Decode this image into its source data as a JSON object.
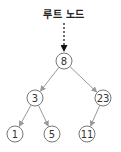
{
  "diagram": {
    "type": "binary-search-tree",
    "root_label": "루트 노드",
    "colors": {
      "edge": "#999999",
      "node_stroke": "#777777",
      "node_fill": "#ffffff",
      "pointer": "#111111",
      "text": "#333333"
    },
    "nodes": [
      {
        "id": "n8",
        "value": "8",
        "cx": 64,
        "cy": 61,
        "r": 8
      },
      {
        "id": "n3",
        "value": "3",
        "cx": 35,
        "cy": 98,
        "r": 8
      },
      {
        "id": "n23",
        "value": "23",
        "cx": 103,
        "cy": 98,
        "r": 8
      },
      {
        "id": "n1",
        "value": "1",
        "cx": 15,
        "cy": 134,
        "r": 8
      },
      {
        "id": "n5",
        "value": "5",
        "cx": 52,
        "cy": 134,
        "r": 8
      },
      {
        "id": "n11",
        "value": "11",
        "cx": 87,
        "cy": 134,
        "r": 8
      }
    ],
    "edges": [
      {
        "from": "n8",
        "to": "n3"
      },
      {
        "from": "n8",
        "to": "n23"
      },
      {
        "from": "n3",
        "to": "n1"
      },
      {
        "from": "n3",
        "to": "n5"
      },
      {
        "from": "n23",
        "to": "n11"
      }
    ]
  }
}
